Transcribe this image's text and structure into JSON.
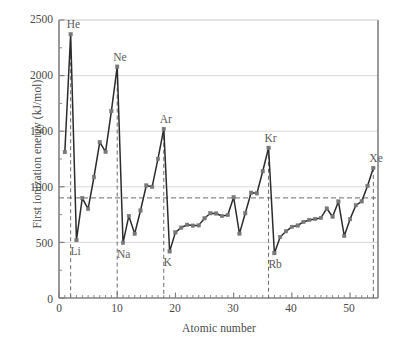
{
  "chart_data": {
    "type": "line",
    "title": "",
    "xlabel": "Atomic number",
    "ylabel": "First ionization energy (kJ/mol)",
    "xlim": [
      0,
      54.8
    ],
    "ylim": [
      0,
      2500
    ],
    "xticks": [
      0,
      10,
      20,
      30,
      40,
      50
    ],
    "yticks": [
      0,
      500,
      1000,
      1500,
      2000,
      2500
    ],
    "grid": "horizontal",
    "legend": "none",
    "reference_line": {
      "orientation": "horizontal",
      "value": 900,
      "style": "dashed"
    },
    "x": [
      1,
      2,
      3,
      4,
      5,
      6,
      7,
      8,
      9,
      10,
      11,
      12,
      13,
      14,
      15,
      16,
      17,
      18,
      19,
      20,
      21,
      22,
      23,
      24,
      25,
      26,
      27,
      28,
      29,
      30,
      31,
      32,
      33,
      34,
      35,
      36,
      37,
      38,
      39,
      40,
      41,
      42,
      43,
      44,
      45,
      46,
      47,
      48,
      49,
      50,
      51,
      52,
      53,
      54
    ],
    "values": [
      1312,
      2372,
      520,
      899,
      801,
      1086,
      1402,
      1314,
      1681,
      2081,
      496,
      738,
      578,
      787,
      1012,
      1000,
      1251,
      1521,
      419,
      590,
      633,
      659,
      651,
      653,
      717,
      762,
      760,
      737,
      746,
      906,
      579,
      762,
      947,
      941,
      1140,
      1351,
      403,
      549,
      600,
      640,
      652,
      684,
      702,
      711,
      720,
      805,
      731,
      868,
      558,
      709,
      834,
      869,
      1008,
      1170
    ],
    "annotations": [
      {
        "label": "He",
        "x": 2,
        "y": 2372,
        "drop_to": 0
      },
      {
        "label": "Ne",
        "x": 10,
        "y": 2081,
        "drop_to": 0
      },
      {
        "label": "Ar",
        "x": 18,
        "y": 1521,
        "drop_to": 0
      },
      {
        "label": "Kr",
        "x": 36,
        "y": 1351,
        "drop_to": 0
      },
      {
        "label": "Xe",
        "x": 54,
        "y": 1170,
        "drop_to": 0
      },
      {
        "label": "Li",
        "x": 3,
        "y": 520,
        "below": true
      },
      {
        "label": "Na",
        "x": 11,
        "y": 496,
        "below": true
      },
      {
        "label": "K",
        "x": 19,
        "y": 419,
        "below": true
      },
      {
        "label": "Rb",
        "x": 37,
        "y": 403,
        "below": true
      }
    ],
    "colors": {
      "line": "#2b2b2b",
      "marker": "#777777",
      "grid": "#d9d9d9",
      "axis": "#808080",
      "dashed": "#6b6b6b",
      "text": "#4a4a4a",
      "background": "#ffffff"
    }
  },
  "axis_labels": {
    "x_title": "Atomic number",
    "y_title": "First ionization energy (kJ/mol)",
    "x_tick_0": "0",
    "x_tick_1": "10",
    "x_tick_2": "20",
    "x_tick_3": "30",
    "x_tick_4": "40",
    "x_tick_5": "50",
    "y_tick_0": "0",
    "y_tick_1": "500",
    "y_tick_2": "1000",
    "y_tick_3": "1500",
    "y_tick_4": "2000",
    "y_tick_5": "2500"
  },
  "point_labels": {
    "he": "He",
    "ne": "Ne",
    "ar": "Ar",
    "kr": "Kr",
    "xe": "Xe",
    "li": "Li",
    "na": "Na",
    "k": "K",
    "rb": "Rb"
  }
}
